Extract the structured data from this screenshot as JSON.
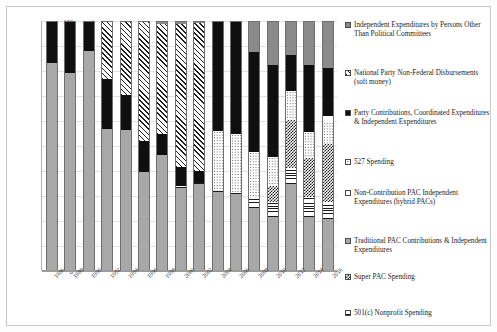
{
  "chart_data": {
    "type": "bar",
    "stacked": true,
    "stack_mode": "percent",
    "title": "",
    "xlabel": "",
    "ylabel": "Percentage",
    "ylim": [
      0,
      100
    ],
    "ytick_values": [
      0,
      10,
      20,
      30,
      40,
      50,
      60,
      70,
      80,
      90,
      100
    ],
    "ytick_labels": [
      "0",
      "10",
      "20",
      "30",
      "40",
      "50",
      "60",
      "70",
      "80",
      "90",
      "100"
    ],
    "grid": true,
    "legend_position": "right",
    "categories": [
      "1986",
      "1988",
      "1990",
      "1992",
      "1994",
      "1996",
      "1998",
      "2000",
      "2002",
      "2004",
      "2006",
      "2008",
      "2010",
      "2012",
      "2014",
      "2016"
    ],
    "series": [
      {
        "name": "Traditional PAC Contributions & Independent Expenditures",
        "pattern": "solid-light-gray",
        "values": [
          83.5,
          79.5,
          88.5,
          57.0,
          56.5,
          39.5,
          46.5,
          33.0,
          34.5,
          31.5,
          30.5,
          25.0,
          21.5,
          34.5,
          21.5,
          20.5
        ]
      },
      {
        "name": "501(c) Nonprofit Spending",
        "pattern": "horizontal-lines",
        "values": [
          0,
          0,
          0,
          0,
          0,
          0,
          0,
          1.0,
          0.5,
          0.5,
          0.5,
          4.0,
          6.0,
          6.5,
          8.0,
          7.0
        ]
      },
      {
        "name": "Super PAC Spending",
        "pattern": "checkerboard",
        "values": [
          0,
          0,
          0,
          0,
          0,
          0,
          0,
          0,
          0,
          0,
          0,
          0,
          6.5,
          19.5,
          15.5,
          23.5
        ]
      },
      {
        "name": "527 Spending",
        "pattern": "fine-dots",
        "values": [
          0,
          0,
          0,
          0,
          0,
          0,
          0,
          0,
          0,
          24.0,
          24.0,
          18.5,
          11.5,
          11.5,
          10.5,
          8.5
        ]
      },
      {
        "name": "Non-Contribution PAC Independent Expenditures (hybrid PACs)",
        "pattern": "white",
        "values": [
          0,
          0,
          0,
          0,
          0,
          0,
          0,
          0,
          0,
          0,
          0,
          0,
          0,
          0,
          0,
          2.5
        ]
      },
      {
        "name": "Party Contributions, Coordinated Expenditures & Independent Expenditures",
        "pattern": "solid-black",
        "values": [
          16.5,
          20.5,
          11.5,
          20.0,
          14.0,
          12.5,
          8.5,
          7.5,
          5.0,
          44.0,
          45.0,
          40.5,
          37.0,
          14.5,
          27.0,
          19.5
        ]
      },
      {
        "name": "National Party Non-Federal Disbursements (soft money)",
        "pattern": "diagonal-hatch",
        "values": [
          0,
          0,
          0,
          23.0,
          29.5,
          48.0,
          44.0,
          57.5,
          59.5,
          0,
          0,
          0,
          0,
          0,
          0,
          0
        ]
      },
      {
        "name": "Independent Expenditures by Persons Other Than Political Committees",
        "pattern": "solid-dark-gray",
        "values": [
          0,
          0,
          0,
          0,
          0,
          0,
          1.0,
          1.0,
          0.5,
          0,
          0,
          12.0,
          17.5,
          13.5,
          17.5,
          18.5
        ]
      }
    ]
  },
  "legend": {
    "items": [
      {
        "label": "Independent Expenditures by Persons Other Than Political Committees",
        "pattern_class": "p-ie-persons"
      },
      {
        "label": "National Party Non-Federal Disbursements (soft money)",
        "pattern_class": "p-softmoney"
      },
      {
        "label": "Party Contributions, Coordinated Expenditures & Independent Expenditures",
        "pattern_class": "p-party"
      },
      {
        "label": "527 Spending",
        "pattern_class": "p-527"
      },
      {
        "label": "Non-Contribution PAC Independent Expenditures (hybrid PACs)",
        "pattern_class": "p-noncontrib"
      },
      {
        "label": "Traditional PAC Contributions & Independent Expenditures",
        "pattern_class": "p-tradpac"
      },
      {
        "label": "Super PAC Spending",
        "pattern_class": "p-superpac"
      },
      {
        "label": "501(c) Nonprofit Spending",
        "pattern_class": "p-501c"
      }
    ]
  }
}
